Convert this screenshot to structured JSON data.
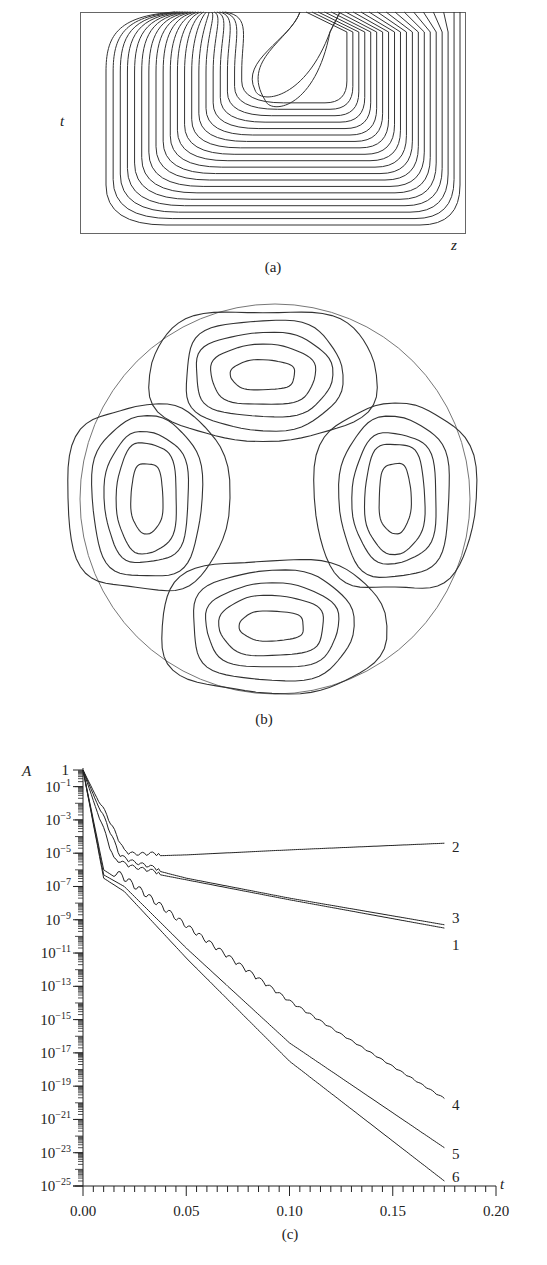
{
  "panels": {
    "a": {
      "caption": "(a)",
      "type": "contour",
      "xlabel": "z",
      "ylabel": "t",
      "contour_count": 22
    },
    "b": {
      "caption": "(b)",
      "type": "contour",
      "description": "circular domain with four lobes (top, bottom, left, right), each with nested closed contours",
      "lobes": [
        "top",
        "right",
        "bottom",
        "left"
      ]
    },
    "c": {
      "caption": "(c)",
      "xlabel": "t",
      "ylabel": "A"
    }
  },
  "chart_data": [
    {
      "panel": "a",
      "type": "heatmap",
      "title": "",
      "xlabel": "z",
      "ylabel": "t",
      "grid": false,
      "notes": "contour plot in rectangular frame; contours concentrated near top at z≈0.4, nested U-shaped level curves"
    },
    {
      "panel": "b",
      "type": "heatmap",
      "title": "",
      "notes": "contour plot on a disk; four symmetric cells at top, right, bottom, left with ~4 nested contours each"
    },
    {
      "panel": "c",
      "type": "line",
      "title": "",
      "xlabel": "t",
      "ylabel": "A",
      "yscale": "log",
      "xlim": [
        0.0,
        0.2
      ],
      "ylim": [
        1e-25,
        1
      ],
      "x_ticks": [
        "0.00",
        "0.05",
        "0.10",
        "0.15",
        "0.20"
      ],
      "y_ticks": [
        "1",
        "10^-1",
        "10^-3",
        "10^-5",
        "10^-7",
        "10^-9",
        "10^-11",
        "10^-13",
        "10^-15",
        "10^-17",
        "10^-19",
        "10^-21",
        "10^-23",
        "10^-25"
      ],
      "y_tick_labels": [
        {
          "base": "1",
          "exp": ""
        },
        {
          "base": "10",
          "exp": "−1"
        },
        {
          "base": "10",
          "exp": "−3"
        },
        {
          "base": "10",
          "exp": "−5"
        },
        {
          "base": "10",
          "exp": "−7"
        },
        {
          "base": "10",
          "exp": "−9"
        },
        {
          "base": "10",
          "exp": "−11"
        },
        {
          "base": "10",
          "exp": "−13"
        },
        {
          "base": "10",
          "exp": "−15"
        },
        {
          "base": "10",
          "exp": "−17"
        },
        {
          "base": "10",
          "exp": "−19"
        },
        {
          "base": "10",
          "exp": "−21"
        },
        {
          "base": "10",
          "exp": "−23"
        },
        {
          "base": "10",
          "exp": "−25"
        }
      ],
      "grid": false,
      "legend": "inline labels at right end of curves",
      "series": [
        {
          "name": "1",
          "t": [
            0.0,
            0.015,
            0.025,
            0.05,
            0.1,
            0.175
          ],
          "log10A": [
            0,
            -5.5,
            -6.0,
            -6.6,
            -7.8,
            -9.5
          ]
        },
        {
          "name": "2",
          "t": [
            0.0,
            0.02,
            0.025,
            0.05,
            0.1,
            0.175
          ],
          "log10A": [
            0,
            -5.0,
            -5.2,
            -5.1,
            -4.8,
            -4.4
          ]
        },
        {
          "name": "3",
          "t": [
            0.0,
            0.018,
            0.025,
            0.05,
            0.1,
            0.175
          ],
          "log10A": [
            0,
            -5.3,
            -5.7,
            -6.5,
            -7.7,
            -9.3
          ]
        },
        {
          "name": "4",
          "t": [
            0.0,
            0.01,
            0.02,
            0.05,
            0.1,
            0.175
          ],
          "log10A": [
            0,
            -6.0,
            -6.8,
            -9.6,
            -14.0,
            -19.8
          ]
        },
        {
          "name": "5",
          "t": [
            0.0,
            0.01,
            0.02,
            0.05,
            0.1,
            0.175
          ],
          "log10A": [
            0,
            -6.3,
            -7.0,
            -10.7,
            -16.4,
            -22.7
          ]
        },
        {
          "name": "6",
          "t": [
            0.0,
            0.01,
            0.02,
            0.05,
            0.1,
            0.175
          ],
          "log10A": [
            0,
            -6.5,
            -7.3,
            -11.3,
            -17.5,
            -24.7
          ]
        }
      ]
    }
  ]
}
